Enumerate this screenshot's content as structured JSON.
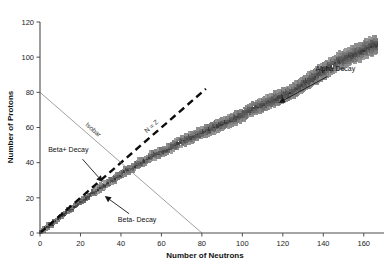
{
  "chart_data": {
    "type": "scatter",
    "title": "",
    "subtitle": "",
    "xlabel": "Number of Neutrons",
    "ylabel": "Number of Protons",
    "xlim": [
      0,
      170
    ],
    "ylim": [
      0,
      120
    ],
    "xticks": [
      0,
      20,
      40,
      60,
      80,
      100,
      120,
      140,
      160
    ],
    "xtick_labels": [
      "0",
      "20",
      "40",
      "60",
      "80",
      "100",
      "120",
      "140",
      "160"
    ],
    "yticks": [
      0,
      20,
      40,
      60,
      80,
      100,
      120
    ],
    "ytick_labels": [
      "0",
      "20",
      "40",
      "60",
      "80",
      "100",
      "120"
    ],
    "grid": false,
    "legend": "none",
    "series": [
      {
        "name": "Known nuclides (valley of stability band)",
        "marker": "square",
        "color": "#2b2b2b",
        "description": "Dense band of nuclide squares rising from the origin and curving below the N=Z line.",
        "band_center": [
          [
            0,
            0
          ],
          [
            2,
            2
          ],
          [
            4,
            4
          ],
          [
            6,
            5
          ],
          [
            8,
            7
          ],
          [
            10,
            9
          ],
          [
            12,
            11
          ],
          [
            14,
            13
          ],
          [
            16,
            14
          ],
          [
            18,
            16
          ],
          [
            20,
            18
          ],
          [
            22,
            19
          ],
          [
            24,
            21
          ],
          [
            26,
            23
          ],
          [
            28,
            24
          ],
          [
            30,
            26
          ],
          [
            32,
            27
          ],
          [
            34,
            29
          ],
          [
            36,
            30
          ],
          [
            38,
            32
          ],
          [
            40,
            33
          ],
          [
            42,
            35
          ],
          [
            44,
            36
          ],
          [
            46,
            37
          ],
          [
            48,
            39
          ],
          [
            50,
            40
          ],
          [
            52,
            41
          ],
          [
            54,
            43
          ],
          [
            56,
            44
          ],
          [
            58,
            45
          ],
          [
            60,
            46
          ],
          [
            64,
            48
          ],
          [
            68,
            51
          ],
          [
            72,
            53
          ],
          [
            76,
            55
          ],
          [
            80,
            57
          ],
          [
            84,
            59
          ],
          [
            88,
            61
          ],
          [
            92,
            63
          ],
          [
            96,
            65
          ],
          [
            100,
            67
          ],
          [
            104,
            70
          ],
          [
            108,
            72
          ],
          [
            112,
            74
          ],
          [
            116,
            76
          ],
          [
            120,
            78
          ],
          [
            124,
            80
          ],
          [
            128,
            83
          ],
          [
            132,
            86
          ],
          [
            136,
            89
          ],
          [
            140,
            92
          ],
          [
            144,
            95
          ],
          [
            148,
            98
          ],
          [
            152,
            100
          ],
          [
            156,
            102
          ],
          [
            160,
            104
          ],
          [
            163,
            106
          ],
          [
            166,
            107
          ]
        ],
        "band_half_width_protons": 4.2,
        "n_points_approx": 2900
      }
    ],
    "reference_lines": [
      {
        "name": "N = Z",
        "label": "N = Z",
        "style": "dashed",
        "color": "#0d0d0d",
        "from": [
          0,
          0
        ],
        "to": [
          82,
          82
        ],
        "label_rotation_deg": -41
      },
      {
        "name": "Isobar",
        "label": "Isobar",
        "style": "solid-thin",
        "color": "#777777",
        "from": [
          0,
          80
        ],
        "to": [
          80,
          0
        ],
        "label_rotation_deg": 41
      }
    ],
    "annotations": [
      {
        "name": "beta-plus-decay",
        "label": "Beta+ Decay",
        "text_at": [
          14,
          46
        ],
        "arrow_from": [
          21,
          42
        ],
        "arrow_to": [
          31,
          29
        ],
        "description": "Arrow pointing down-right toward the proton-rich edge of the band."
      },
      {
        "name": "beta-minus-decay",
        "label": "Beta- Decay",
        "text_at": [
          48,
          6
        ],
        "arrow_from": [
          44,
          11
        ],
        "arrow_to": [
          32,
          21
        ],
        "description": "Arrow pointing up-left toward the neutron-rich edge of the band."
      },
      {
        "name": "alpha-decay",
        "label": "Alpha Decay",
        "text_at": [
          146,
          92
        ],
        "arrow_from": [
          142,
          89
        ],
        "arrow_to": [
          118,
          74
        ],
        "description": "Arrow pointing down-left toward the heavy end of the band."
      }
    ]
  }
}
